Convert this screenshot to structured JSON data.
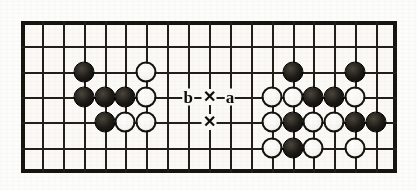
{
  "diagram": {
    "kind": "go-board-diagram",
    "board": {
      "columns": 18,
      "rows": 6,
      "left": 21,
      "top": 21,
      "width": 376,
      "height": 152,
      "cell_size": 21.8,
      "line_color": "#221f18",
      "border_color": "#17150f",
      "background_color": "#fbfaf7"
    },
    "colors": {
      "black_stone": "#1c1a15",
      "white_stone": "#f7f6f2",
      "stone_outline": "#14120d",
      "label_color": "#100e0a",
      "page_background": "#ffffff"
    },
    "stones": [
      {
        "color": "black",
        "col": 3,
        "row": 2
      },
      {
        "color": "white",
        "col": 6,
        "row": 2
      },
      {
        "color": "black",
        "col": 3,
        "row": 3
      },
      {
        "color": "black",
        "col": 4,
        "row": 3
      },
      {
        "color": "black",
        "col": 5,
        "row": 3
      },
      {
        "color": "white",
        "col": 6,
        "row": 3
      },
      {
        "color": "black",
        "col": 4,
        "row": 4
      },
      {
        "color": "white",
        "col": 5,
        "row": 4
      },
      {
        "color": "white",
        "col": 6,
        "row": 4
      },
      {
        "color": "black",
        "col": 13,
        "row": 2
      },
      {
        "color": "black",
        "col": 16,
        "row": 2
      },
      {
        "color": "white",
        "col": 12,
        "row": 3
      },
      {
        "color": "white",
        "col": 13,
        "row": 3
      },
      {
        "color": "black",
        "col": 14,
        "row": 3
      },
      {
        "color": "black",
        "col": 15,
        "row": 3
      },
      {
        "color": "white",
        "col": 16,
        "row": 3
      },
      {
        "color": "white",
        "col": 12,
        "row": 4
      },
      {
        "color": "black",
        "col": 13,
        "row": 4
      },
      {
        "color": "white",
        "col": 14,
        "row": 4
      },
      {
        "color": "white",
        "col": 15,
        "row": 4
      },
      {
        "color": "black",
        "col": 16,
        "row": 4
      },
      {
        "color": "black",
        "col": 17,
        "row": 4
      },
      {
        "color": "white",
        "col": 12,
        "row": 5
      },
      {
        "color": "black",
        "col": 13,
        "row": 5
      },
      {
        "color": "white",
        "col": 14,
        "row": 5
      },
      {
        "color": "white",
        "col": 16,
        "row": 5
      }
    ],
    "marks": [
      {
        "id": "label-b",
        "text": "b",
        "type": "letter",
        "col": 8,
        "row": 3
      },
      {
        "id": "cross-upper",
        "text": "✕",
        "type": "cross",
        "col": 9,
        "row": 3
      },
      {
        "id": "label-a",
        "text": "a",
        "type": "letter",
        "col": 10,
        "row": 3
      },
      {
        "id": "cross-lower",
        "text": "✕",
        "type": "cross",
        "col": 9,
        "row": 4
      }
    ]
  }
}
